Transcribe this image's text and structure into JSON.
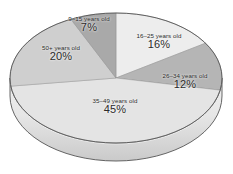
{
  "chart_data": {
    "type": "pie",
    "title": "",
    "subtitle": "",
    "xlabel": "",
    "ylabel": "",
    "legend_position": "none",
    "grid": false,
    "style": "3d-pie-grayscale",
    "units": "percent",
    "categories": [
      "16–25 years old",
      "26–34 years old",
      "35–49 years old",
      "50+ years old",
      "9–15 years old"
    ],
    "values": [
      16,
      12,
      45,
      20,
      7
    ],
    "value_labels": [
      "16%",
      "12%",
      "45%",
      "20%",
      "7%"
    ],
    "colors": [
      "#ededed",
      "#b5b5b5",
      "#e4e4e4",
      "#cfcfcf",
      "#a9a9a9"
    ],
    "slices": [
      {
        "id": "slice-16-25",
        "category": "16–25 years old",
        "value": 16,
        "value_label": "16%",
        "color": "#ededed",
        "start_angle_deg": 0,
        "end_angle_deg": 57.6
      },
      {
        "id": "slice-26-34",
        "category": "26–34 years old",
        "value": 12,
        "value_label": "12%",
        "color": "#b5b5b5",
        "start_angle_deg": 57.6,
        "end_angle_deg": 100.8
      },
      {
        "id": "slice-35-49",
        "category": "35–49 years old",
        "value": 45,
        "value_label": "45%",
        "color": "#e4e4e4",
        "start_angle_deg": 100.8,
        "end_angle_deg": 262.8
      },
      {
        "id": "slice-50-plus",
        "category": "50+ years old",
        "value": 20,
        "value_label": "20%",
        "color": "#cfcfcf",
        "start_angle_deg": 262.8,
        "end_angle_deg": 334.8
      },
      {
        "id": "slice-9-15",
        "category": "9–15 years old",
        "value": 7,
        "value_label": "7%",
        "color": "#a9a9a9",
        "start_angle_deg": 334.8,
        "end_angle_deg": 360
      }
    ]
  },
  "labels": {
    "age_9_15": {
      "category": "9–15 years old",
      "value": "7%"
    },
    "age_16_25": {
      "category": "16–25 years old",
      "value": "16%"
    },
    "age_26_34": {
      "category": "26–34 years old",
      "value": "12%"
    },
    "age_35_49": {
      "category": "35–49 years old",
      "value": "45%"
    },
    "age_50_plus": {
      "category": "50+ years old",
      "value": "20%"
    }
  },
  "appearance": {
    "background": "#ffffff",
    "outline": "#555555",
    "side_wall_top": "#e9e9e9",
    "side_wall_bottom": "#cdcdcd",
    "text_color": "#2a2a2a"
  }
}
